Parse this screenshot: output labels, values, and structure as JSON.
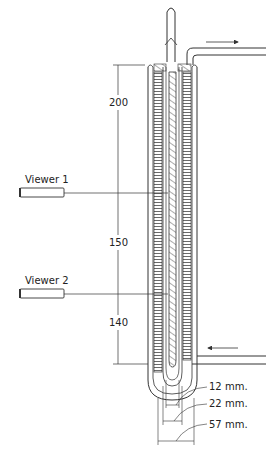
{
  "diagram": {
    "type": "apparatus cross-section",
    "viewers": [
      {
        "label": "Viewer 1",
        "y": 193
      },
      {
        "label": "Viewer 2",
        "y": 294
      }
    ],
    "height_dimensions": [
      {
        "label": "200",
        "y": 102
      },
      {
        "label": "150",
        "y": 242
      },
      {
        "label": "140",
        "y": 322
      }
    ],
    "width_dimensions": [
      {
        "label": "12 mm.",
        "y": 385
      },
      {
        "label": "22 mm.",
        "y": 402
      },
      {
        "label": "57 mm.",
        "y": 423
      }
    ],
    "colors": {
      "line": "#333333",
      "background": "#ffffff"
    }
  }
}
